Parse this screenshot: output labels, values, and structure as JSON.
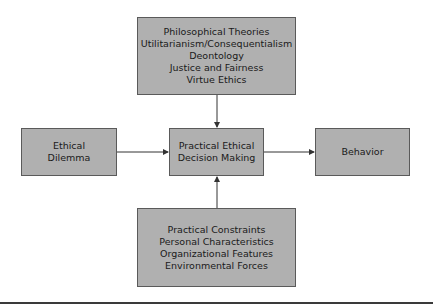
{
  "diagram": {
    "top_box": {
      "lines": [
        "Philosophical Theories",
        "Utilitarianism/Consequentialism",
        "Deontology",
        "Justice and Fairness",
        "Virtue Ethics"
      ]
    },
    "left_box": {
      "lines": [
        "Ethical",
        "Dilemma"
      ]
    },
    "center_box": {
      "lines": [
        "Practical Ethical",
        "Decision Making"
      ]
    },
    "right_box": {
      "lines": [
        "Behavior"
      ]
    },
    "bottom_box": {
      "lines": [
        "Practical Constraints",
        "Personal Characteristics",
        "Organizational Features",
        "Environmental Forces"
      ]
    },
    "edges": [
      {
        "from": "top_box",
        "to": "center_box"
      },
      {
        "from": "left_box",
        "to": "center_box"
      },
      {
        "from": "bottom_box",
        "to": "center_box"
      },
      {
        "from": "center_box",
        "to": "right_box"
      }
    ],
    "colors": {
      "box_fill": "#b0b0b0",
      "box_border": "#5a5a5a",
      "line": "#333333"
    }
  }
}
